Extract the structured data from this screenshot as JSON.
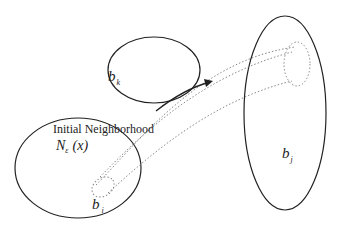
{
  "diagram": {
    "sets": [
      {
        "id": "b_i",
        "label_main": "b",
        "label_sub": "i"
      },
      {
        "id": "b_k",
        "label_main": "b",
        "label_sub": "k"
      },
      {
        "id": "b_j",
        "label_main": "b",
        "label_sub": "j"
      }
    ],
    "annotation": {
      "title": "Initial Neighborhood",
      "symbol_main": "N",
      "symbol_sub": "ε",
      "symbol_arg": "(x)"
    },
    "colors": {
      "stroke": "#222222",
      "dotted": "#888888"
    }
  }
}
